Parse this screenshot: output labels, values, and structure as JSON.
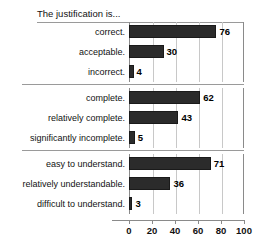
{
  "chart_data": {
    "type": "bar",
    "orientation": "horizontal",
    "title": "The justification is...",
    "xlabel": "",
    "ylabel": "",
    "xlim": [
      0,
      100
    ],
    "xticks": [
      0,
      20,
      40,
      60,
      80,
      100
    ],
    "grid": true,
    "legend": false,
    "bar_color": "#2b2b2b",
    "panels": [
      {
        "name": "correctness",
        "categories": [
          "correct.",
          "acceptable.",
          "incorrect."
        ],
        "values": [
          76,
          30,
          4
        ]
      },
      {
        "name": "completeness",
        "categories": [
          "complete.",
          "relatively complete.",
          "significantly incomplete."
        ],
        "values": [
          62,
          43,
          5
        ]
      },
      {
        "name": "understandability",
        "categories": [
          "easy to understand.",
          "relatively understandable.",
          "difficult to understand."
        ],
        "values": [
          71,
          36,
          3
        ]
      }
    ]
  },
  "axis": {
    "ticks": [
      {
        "label": "0"
      },
      {
        "label": "20"
      },
      {
        "label": "40"
      },
      {
        "label": "60"
      },
      {
        "label": "80"
      },
      {
        "label": "100"
      }
    ]
  }
}
